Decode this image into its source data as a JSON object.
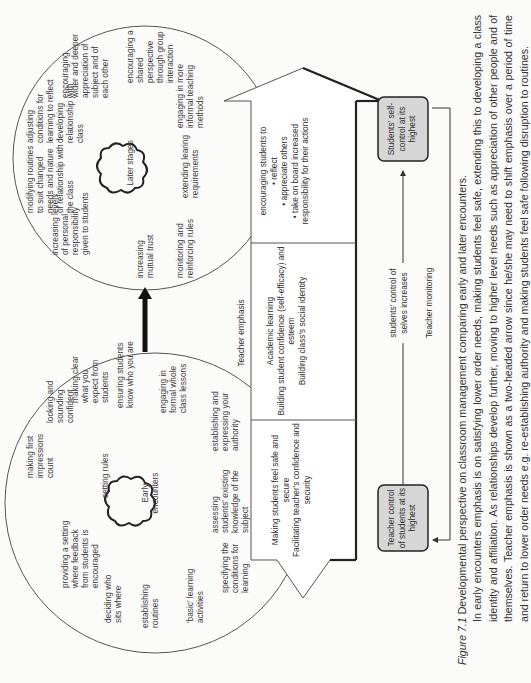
{
  "figure": {
    "label": "Figure 7.1",
    "title": "Developmental perspective on classroom management comparing early and later encounters.",
    "body": "In early encounters emphasis is on satisfying lower order needs, making students feel safe, extending this to developing a class identity and affiliation. As relationships develop further, moving to higher level needs such as appreciation of other people and of themselves. Teacher emphasis is shown as a two-headed arrow since he/she may need to shift emphasis over a period of time and return to lower order needs e.g. re-establishing authority and making students feel safe following disruption to routines."
  },
  "early_circle": {
    "center_label": "Early encounters",
    "items": [
      "making first impressions count",
      "looking and sounding confident",
      "providing a setting where feedback from students is encouraged",
      "setting rules",
      "making clear what you expect from students",
      "ensuring students know who you are",
      "deciding who sits where",
      "establishing routines",
      "engaging in formal whole class lessons",
      "'basic' learning activities",
      "specifying the conditions for learning",
      "assessing students' existing knowledge of the subject",
      "establishing and expressing your authority"
    ]
  },
  "later_circle": {
    "center_label": "Later stages",
    "items": [
      "increasing levels of personal responsibility given to students",
      "modifying routines to suit changed needs and nature of relationship with the class",
      "adjusting conditions for learning to reflect developing relationship with class",
      "encouraging wider and deeper appreciation of subject and of each other",
      "increasing mutual trust",
      "monitoring and reinforcing rules",
      "extending learing requirements",
      "engaging in more informal teaching methods",
      "encouraging a shared perspective through group interaction"
    ]
  },
  "teacher_emphasis": {
    "heading": "Teacher emphasis",
    "sections": [
      "Making students feel safe and secure\nFacilitating teacher's confidence and security",
      "Academic learning\nBuilding student confidence (self-efficacy) and esteem\nBuilding class's social identity",
      "encouraging students to\n• reflect\n• appreciate others\n• take on board increased responsibility for their actions"
    ]
  },
  "control_boxes": {
    "start": "Teacher control of students at its highest",
    "end": "Students' self-control at its highest",
    "progress_label": "students' control of selves increases",
    "feedback_label": "Teacher monitoring"
  },
  "colors": {
    "box_fill": "#d6d6d6",
    "line": "#333333",
    "background": "#fbfbfa"
  }
}
